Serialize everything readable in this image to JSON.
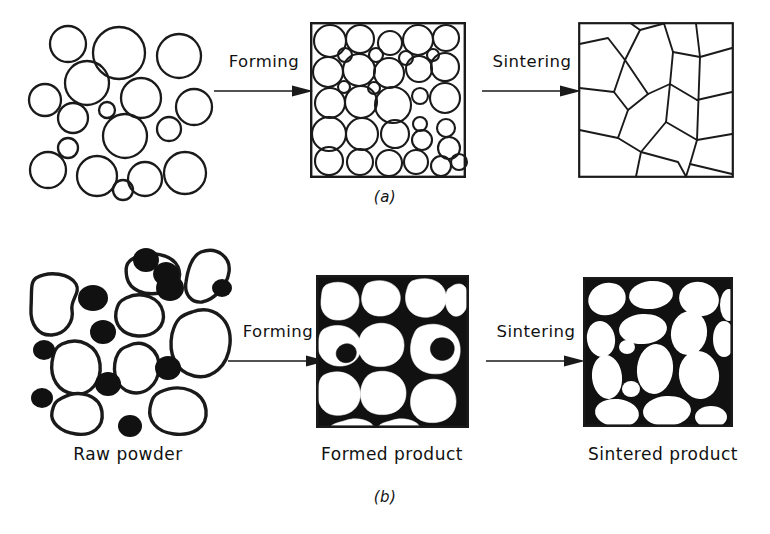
{
  "figure": {
    "panels": [
      {
        "id": "a",
        "label": "(a)",
        "description": "Single-phase spherical powder: loose powder, formed compact, sintered polycrystalline grain structure",
        "stages": [
          {
            "name": "raw-powder",
            "kind": "loose-spheres"
          },
          {
            "name": "formed-product",
            "kind": "packed-spheres-in-box"
          },
          {
            "name": "sintered-product",
            "kind": "grain-boundary-polygons"
          }
        ],
        "arrows": [
          {
            "name": "forming-arrow",
            "label": "Forming"
          },
          {
            "name": "sintering-arrow",
            "label": "Sintering"
          }
        ]
      },
      {
        "id": "b",
        "label": "(b)",
        "description": "Two-phase powder: irregular white grains plus black secondary particles, compacted then sintered",
        "stages": [
          {
            "name": "raw-powder",
            "kind": "loose-irregular-plus-black"
          },
          {
            "name": "formed-product",
            "kind": "packed-grains-black-matrix"
          },
          {
            "name": "sintered-product",
            "kind": "rounded-grains-black-matrix"
          }
        ],
        "arrows": [
          {
            "name": "forming-arrow",
            "label": "Forming"
          },
          {
            "name": "sintering-arrow",
            "label": "Sintering"
          }
        ]
      }
    ],
    "captions": {
      "raw_powder": "Raw powder",
      "formed_product": "Formed product",
      "sintered_product": "Sintered product"
    },
    "colors": {
      "ink": "#1a1a1a",
      "background": "#ffffff",
      "second_phase": "#111111"
    }
  }
}
